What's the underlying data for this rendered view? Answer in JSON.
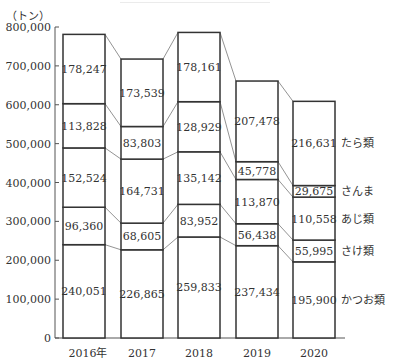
{
  "chart_data": {
    "type": "bar",
    "stacked": true,
    "title": "",
    "xlabel": "",
    "ylabel": "（トン）",
    "ylim": [
      0,
      800000
    ],
    "yticks": [
      0,
      100000,
      200000,
      300000,
      400000,
      500000,
      600000,
      700000,
      800000
    ],
    "ytick_labels": [
      "0",
      "100,000",
      "200,000",
      "300,000",
      "400,000",
      "500,000",
      "600,000",
      "700,000",
      "800,000"
    ],
    "categories": [
      "2016年",
      "2017",
      "2018",
      "2019",
      "2020"
    ],
    "series": [
      {
        "name": "かつお類",
        "values": [
          240051,
          226865,
          259833,
          237434,
          195900
        ],
        "labels": [
          "240,051",
          "226,865",
          "259,833",
          "237,434",
          "195,900"
        ]
      },
      {
        "name": "さけ類",
        "values": [
          96360,
          68605,
          83952,
          56438,
          55995
        ],
        "labels": [
          "96,360",
          "68,605",
          "83,952",
          "56,438",
          "55,995"
        ]
      },
      {
        "name": "あじ類",
        "values": [
          152524,
          164731,
          135142,
          113870,
          110558
        ],
        "labels": [
          "152,524",
          "164,731",
          "135,142",
          "113,870",
          "110,558"
        ]
      },
      {
        "name": "さんま",
        "values": [
          113828,
          83803,
          128929,
          45778,
          29675
        ],
        "labels": [
          "113,828",
          "83,803",
          "128,929",
          "45,778",
          "29,675"
        ]
      },
      {
        "name": "たら類",
        "values": [
          178247,
          173539,
          178161,
          207478,
          216631
        ],
        "labels": [
          "178,247",
          "173,539",
          "178,161",
          "207,478",
          "216,631"
        ]
      }
    ],
    "legend_position": "right of last bar (inline labels)",
    "grid": false,
    "connector_lines": true
  },
  "colors": {
    "bar_fill": "#ffffff",
    "bar_stroke": "#333333",
    "connector": "#777777",
    "axis": "#555555"
  }
}
